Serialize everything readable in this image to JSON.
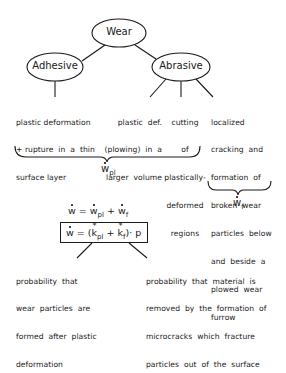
{
  "diagram": {
    "root": {
      "label": "Wear"
    },
    "branches": [
      {
        "label": "Adhesive"
      },
      {
        "label": "Abrasive"
      }
    ],
    "mechanisms": [
      {
        "id": "adhesive-1",
        "lines": [
          "plastic deformation",
          "+ rupture  in  a  thin",
          "surface layer"
        ]
      },
      {
        "id": "abrasive-1",
        "lines": [
          "plastic  def.",
          "(plowing)  in  a",
          "larger  volume"
        ]
      },
      {
        "id": "abrasive-2",
        "lines": [
          "cutting",
          "of",
          "plastically-",
          "deformed",
          "regions"
        ]
      },
      {
        "id": "abrasive-3",
        "lines": [
          "localized",
          "cracking  and",
          "formation  of",
          "broken  wear",
          "particles  below",
          "and  beside  a",
          "plowed  wear",
          "furrow"
        ]
      }
    ],
    "brace_labels": {
      "plastic": {
        "base": "w",
        "sub": "pl"
      },
      "fracture": {
        "base": "w",
        "sub": "f"
      }
    },
    "equations": {
      "sum": {
        "lhs": "w",
        "eq": "=",
        "t1": "w",
        "t1sub": "pl",
        "plus": "+",
        "t2": "w",
        "t2sub": "f"
      },
      "boxed": {
        "lhs": "w",
        "eq": "= (",
        "k1": "k",
        "k1sub": "pl",
        "star": "*",
        "plus": "+",
        "k2": "k",
        "k2sub": "f",
        "tail": ")· p"
      }
    },
    "annotations": {
      "left": [
        "probability  that",
        "wear  particles  are",
        "formed  after  plastic",
        "deformation"
      ],
      "right": [
        "probability  that  material  is",
        "removed  by  the  formation  of",
        "microcracks  which  fracture",
        "particles  out  of  the  surface"
      ]
    }
  }
}
